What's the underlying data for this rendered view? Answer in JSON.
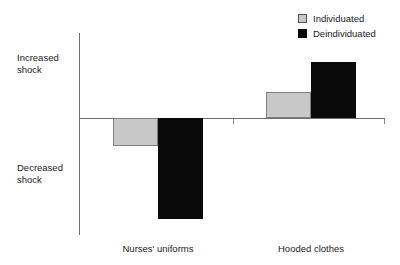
{
  "chart_data": {
    "type": "bar",
    "title": "",
    "subtitle": "",
    "xlabel": "",
    "ylabel": "",
    "categories": [
      "Nurses' uniforms",
      "Hooded clothes"
    ],
    "series": [
      {
        "name": "Individuated",
        "color": "#c8c8c8",
        "values": [
          -28,
          26
        ]
      },
      {
        "name": "Deindividuated",
        "color": "#0a0a0a",
        "values": [
          -101,
          56
        ]
      }
    ],
    "y_axis_top_label": "Increased\nshock",
    "y_axis_bottom_label": "Decreased\nshock",
    "ylim": [
      -117,
      86
    ],
    "grid": false,
    "legend_position": "top-right",
    "zero_line": true,
    "axis_color": "#6e6e6e"
  },
  "legend": {
    "items": [
      {
        "label": "Individuated",
        "swatch": "gray-swatch-icon"
      },
      {
        "label": "Deindividuated",
        "swatch": "black-swatch-icon"
      }
    ]
  },
  "axis": {
    "increased_label": "Increased\nshock",
    "decreased_label": "Decreased\nshock"
  },
  "categories": {
    "first": "Nurses' uniforms",
    "second": "Hooded clothes"
  }
}
